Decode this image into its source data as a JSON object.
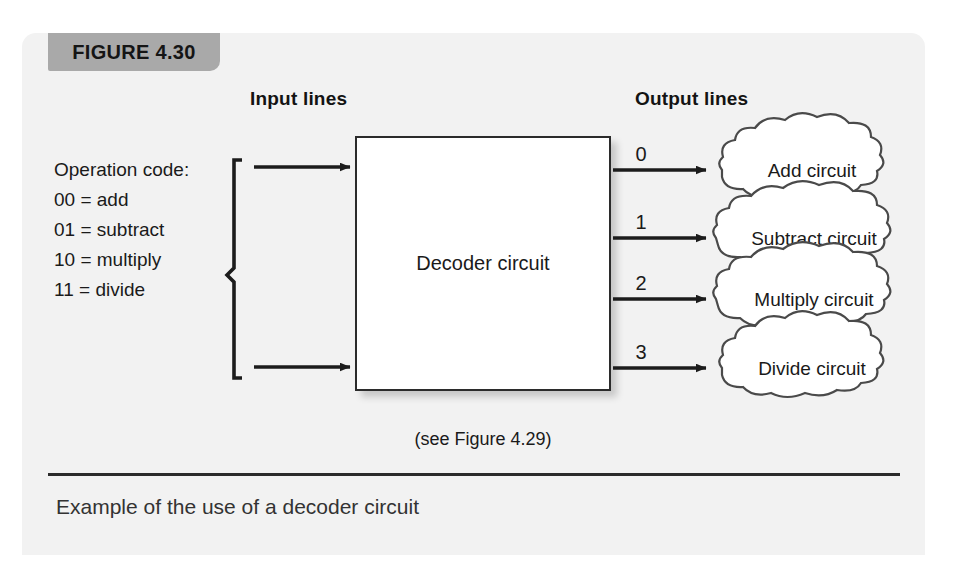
{
  "figure": {
    "tab_label": "FIGURE 4.30",
    "caption": "Example of the use of a decoder circuit",
    "note": "(see Figure 4.29)"
  },
  "headers": {
    "input": "Input lines",
    "output": "Output lines"
  },
  "opcode": {
    "title": "Operation code:",
    "lines": [
      "00 = add",
      "01 = subtract",
      "10 = multiply",
      "11 = divide"
    ]
  },
  "decoder": {
    "label": "Decoder circuit"
  },
  "outputs": [
    {
      "number": "0",
      "target": "Add circuit"
    },
    {
      "number": "1",
      "target": "Subtract circuit"
    },
    {
      "number": "2",
      "target": "Multiply circuit"
    },
    {
      "number": "3",
      "target": "Divide circuit"
    }
  ],
  "colors": {
    "panel_background": "#f2f2f2",
    "tab_background": "#a9a9a9",
    "ink": "#1a1a1a",
    "box_fill": "#ffffff"
  }
}
